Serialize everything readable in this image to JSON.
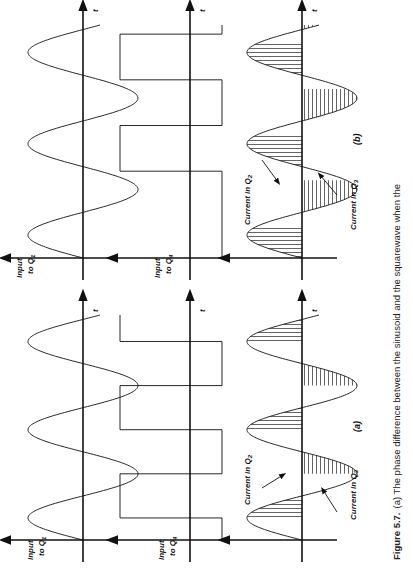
{
  "figure": {
    "caption_number": "Figure 5.7.",
    "caption_text": "(a) The phase difference between the sinusoid and the squarewave when the",
    "panels": [
      {
        "id": "a",
        "label": "(a)"
      },
      {
        "id": "b",
        "label": "(b)"
      }
    ],
    "rows": {
      "row1_label_line1": "Input",
      "row1_label_line2": "to Q",
      "row1_sub": "1",
      "row2_label_line1": "Input",
      "row2_label_line2": "to Q",
      "row2_sub": "4",
      "time_axis": "t"
    },
    "annotations": {
      "current_q2": "Current in Q",
      "current_q2_sub": "2",
      "current_q3": "Current in Q",
      "current_q3_sub": "3"
    }
  }
}
